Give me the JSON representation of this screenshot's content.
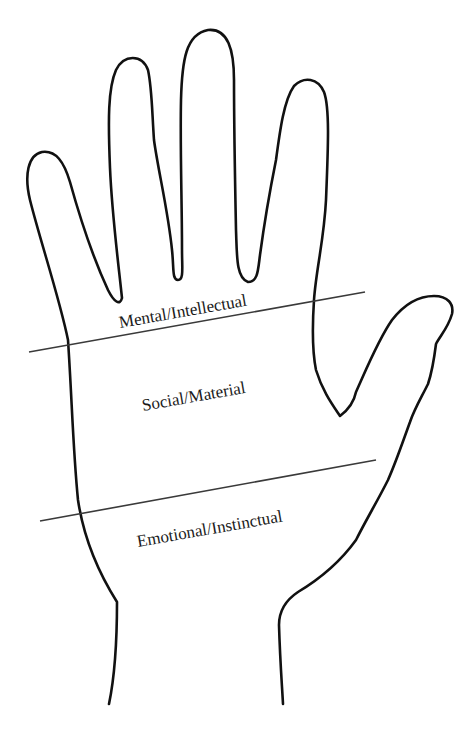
{
  "diagram": {
    "zones": [
      {
        "label": "Mental/Intellectual"
      },
      {
        "label": "Social/Material"
      },
      {
        "label": "Emotional/Instinctual"
      }
    ],
    "colors": {
      "background": "#ffffff",
      "outline": "#111111",
      "divider": "#3a3a3a",
      "text": "#1a1a1a"
    }
  }
}
